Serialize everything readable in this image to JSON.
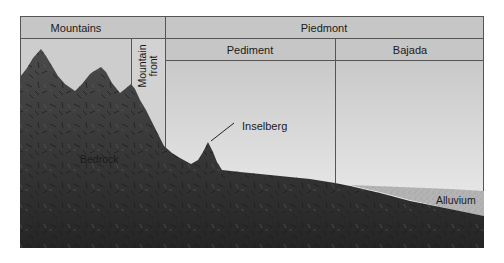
{
  "diagram": {
    "type": "geologic-cross-section",
    "header": {
      "row1": {
        "mountains": "Mountains",
        "piedmont": "Piedmont"
      },
      "row2": {
        "mountain_front_line1": "Mountain",
        "mountain_front_line2": "front",
        "pediment": "Pediment",
        "bajada": "Bajada"
      }
    },
    "labels": {
      "bedrock": "Bedrock",
      "inselberg": "Inselberg",
      "alluvium": "Alluvium"
    },
    "colors": {
      "header_fill": "#c6c6c6",
      "sky_top": "#c9c9c9",
      "sky_bottom": "#f2f2f2",
      "bedrock": "#3a3a3a",
      "bedrock_dark": "#262626",
      "alluvium": "#b4b4b4",
      "border": "#555555"
    }
  }
}
